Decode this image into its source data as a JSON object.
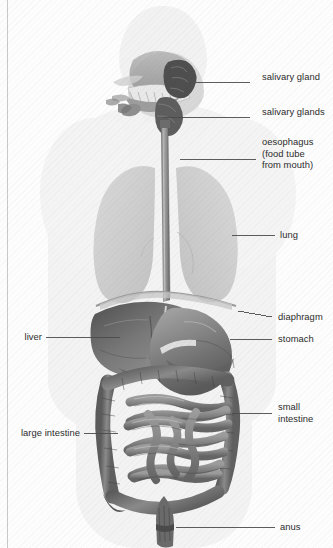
{
  "diagram": {
    "background_color": "#fdfdfd",
    "ink_color": "#2b2b2b",
    "leader_line_color": "#4a4a4a"
  },
  "labels": {
    "right": [
      {
        "id": "salivary-gland",
        "lines": [
          "salivary gland"
        ],
        "text": "salivary gland",
        "text_x": 262,
        "text_y": 77,
        "leader": {
          "x1": 250,
          "y1": 82,
          "x2": 196,
          "y2": 82
        }
      },
      {
        "id": "salivary-glands",
        "lines": [
          "salivary glands"
        ],
        "text": "salivary glands",
        "text_x": 262,
        "text_y": 112,
        "leader": {
          "x1": 250,
          "y1": 117,
          "x2": 163,
          "y2": 117
        }
      },
      {
        "id": "oesophagus",
        "lines": [
          "oesophagus",
          "(food tube",
          "from mouth)"
        ],
        "text": "oesophagus\n(food tube\nfrom mouth)",
        "text_x": 262,
        "text_y": 142,
        "leader": {
          "x1": 256,
          "y1": 159,
          "x2": 180,
          "y2": 159
        }
      },
      {
        "id": "lung",
        "lines": [
          "lung"
        ],
        "text": "lung",
        "text_x": 280,
        "text_y": 230,
        "leader": {
          "x1": 275,
          "y1": 235,
          "x2": 232,
          "y2": 235
        }
      },
      {
        "id": "diaphragm",
        "lines": [
          "diaphragm"
        ],
        "text": "diaphragm",
        "text_x": 278,
        "text_y": 312,
        "leader": {
          "x1": 272,
          "y1": 317,
          "x2": 238,
          "y2": 311
        }
      },
      {
        "id": "stomach",
        "lines": [
          "stomach"
        ],
        "text": "stomach",
        "text_x": 278,
        "text_y": 334,
        "leader": {
          "x1": 272,
          "y1": 339,
          "x2": 230,
          "y2": 339
        }
      },
      {
        "id": "small-intestine",
        "lines": [
          "small",
          "intestine"
        ],
        "text": "small\nintestine",
        "text_x": 278,
        "text_y": 407,
        "leader": {
          "x1": 272,
          "y1": 413,
          "x2": 232,
          "y2": 413
        }
      },
      {
        "id": "anus",
        "lines": [
          "anus"
        ],
        "text": "anus",
        "text_x": 280,
        "text_y": 522,
        "leader": {
          "x1": 275,
          "y1": 527,
          "x2": 176,
          "y2": 527
        }
      }
    ],
    "left": [
      {
        "id": "liver",
        "lines": [
          "liver"
        ],
        "text": "liver",
        "text_x": 14,
        "text_y": 332,
        "leader": {
          "x1": 46,
          "y1": 337,
          "x2": 120,
          "y2": 337
        }
      },
      {
        "id": "large-intestine",
        "lines": [
          "large intestine"
        ],
        "text": "large intestine",
        "text_x": 11,
        "text_y": 428,
        "leader": {
          "x1": 84,
          "y1": 433,
          "x2": 118,
          "y2": 433
        }
      }
    ]
  },
  "organs": {
    "mouth_cavity": {
      "name": "mouth-and-tongue",
      "shade": "#9a9a9a"
    },
    "teeth": {
      "name": "teeth",
      "shade": "#efefef"
    },
    "salivary_gland_upper": {
      "name": "parotid-gland",
      "shade": "#585858"
    },
    "salivary_gland_lower": {
      "name": "submandibular-gland",
      "shade": "#6b6b6b"
    },
    "oesophagus": {
      "name": "oesophagus-tube",
      "shade": "#8e8e8e"
    },
    "lung_left": {
      "name": "lung-left",
      "shade": "#d0d0d0"
    },
    "lung_right": {
      "name": "lung-right",
      "shade": "#cdcdcd"
    },
    "diaphragm": {
      "name": "diaphragm-dome",
      "shade": "#bdbdbd"
    },
    "liver": {
      "name": "liver-mass",
      "shade": "#6f6f6f"
    },
    "stomach": {
      "name": "stomach-sac",
      "shade": "#7c7c7c"
    },
    "small_intestine": {
      "name": "small-intestine-coils",
      "shade": "#7a7a7a"
    },
    "large_intestine": {
      "name": "large-intestine-frame",
      "shade": "#6d6d6d"
    },
    "rectum": {
      "name": "rectum-and-anus",
      "shade": "#5e5e5e"
    }
  }
}
